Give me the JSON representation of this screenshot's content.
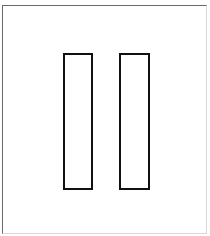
{
  "diagram": {
    "frame": {
      "left": 2,
      "top": 5,
      "width": 205,
      "height": 229
    },
    "shapes": [
      {
        "id": "left-rectangle",
        "left": 63,
        "top": 53,
        "width": 30,
        "height": 137,
        "stroke": "#111111"
      },
      {
        "id": "right-rectangle",
        "left": 119,
        "top": 53,
        "width": 31,
        "height": 137,
        "stroke": "#111111"
      }
    ]
  }
}
